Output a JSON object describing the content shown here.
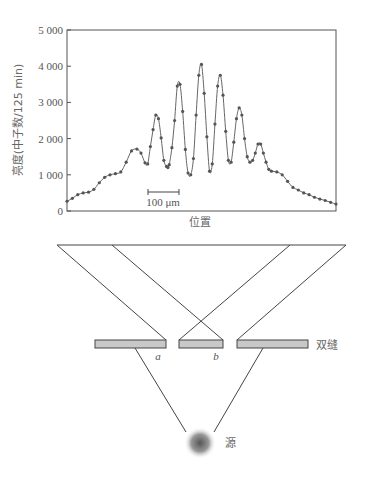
{
  "chart_data": {
    "type": "line",
    "title": "",
    "xlabel": "位置",
    "ylabel": "亮度(中子数/125 min)",
    "ylim": [
      0,
      5000
    ],
    "yticks": [
      0,
      1000,
      2000,
      3000,
      4000,
      5000
    ],
    "ytick_labels": [
      "0",
      "1 000",
      "2 000",
      "3 000",
      "4 000",
      "5 000"
    ],
    "grid": false,
    "legend": null,
    "scale_bar": {
      "label": "100 μm",
      "length_fraction": 0.115
    },
    "markers": "filled-circles",
    "x_fraction": [
      0.0,
      0.02,
      0.04,
      0.06,
      0.08,
      0.1,
      0.12,
      0.14,
      0.16,
      0.18,
      0.2,
      0.22,
      0.24,
      0.26,
      0.275,
      0.29,
      0.3,
      0.31,
      0.32,
      0.33,
      0.34,
      0.35,
      0.36,
      0.37,
      0.375,
      0.38,
      0.39,
      0.4,
      0.41,
      0.42,
      0.43,
      0.44,
      0.45,
      0.46,
      0.47,
      0.48,
      0.49,
      0.5,
      0.51,
      0.52,
      0.53,
      0.54,
      0.55,
      0.56,
      0.57,
      0.58,
      0.59,
      0.6,
      0.61,
      0.62,
      0.63,
      0.64,
      0.65,
      0.66,
      0.67,
      0.68,
      0.69,
      0.7,
      0.71,
      0.72,
      0.73,
      0.74,
      0.75,
      0.76,
      0.78,
      0.8,
      0.82,
      0.84,
      0.86,
      0.88,
      0.9,
      0.92,
      0.94,
      0.96,
      0.98,
      1.0
    ],
    "values": [
      270,
      350,
      450,
      500,
      520,
      600,
      780,
      930,
      1000,
      1030,
      1080,
      1350,
      1660,
      1710,
      1600,
      1330,
      1300,
      1780,
      2250,
      2650,
      2550,
      2020,
      1400,
      1230,
      1200,
      1280,
      1750,
      2500,
      3450,
      3500,
      2750,
      1700,
      1050,
      1000,
      1450,
      2650,
      3750,
      4050,
      3250,
      2050,
      1100,
      1300,
      2400,
      3450,
      3750,
      3200,
      2200,
      1400,
      1350,
      1900,
      2550,
      2850,
      2650,
      2000,
      1500,
      1350,
      1400,
      1600,
      1850,
      1850,
      1600,
      1350,
      1150,
      1100,
      1080,
      1000,
      820,
      650,
      580,
      500,
      450,
      380,
      330,
      290,
      240,
      190
    ]
  },
  "diagram": {
    "slit_label": "双缝",
    "slit_a_label": "a",
    "slit_b_label": "b",
    "source_label": "源"
  },
  "colors": {
    "line": "#666666",
    "marker": "#555555",
    "slit_fill": "#c8c8c8",
    "frame": "#444444"
  }
}
